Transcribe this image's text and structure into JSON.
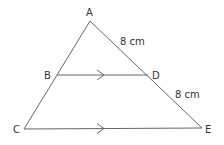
{
  "diagram": {
    "type": "geometry-triangle",
    "stroke_color": "#666666",
    "text_color": "#333333",
    "points": {
      "A": {
        "label": "A",
        "x": 90,
        "y": 21
      },
      "B": {
        "label": "B",
        "x": 57,
        "y": 75
      },
      "C": {
        "label": "C",
        "x": 24,
        "y": 129
      },
      "D": {
        "label": "D",
        "x": 148,
        "y": 75
      },
      "E": {
        "label": "E",
        "x": 202,
        "y": 128
      }
    },
    "segments": [
      {
        "from": "A",
        "to": "C"
      },
      {
        "from": "A",
        "to": "E"
      },
      {
        "from": "B",
        "to": "D",
        "parallel_mark": "single-arrow"
      },
      {
        "from": "C",
        "to": "E",
        "parallel_mark": "single-arrow"
      }
    ],
    "measurements": [
      {
        "segment": "AD",
        "label": "8 cm"
      },
      {
        "segment": "DE",
        "label": "8 cm"
      }
    ]
  }
}
